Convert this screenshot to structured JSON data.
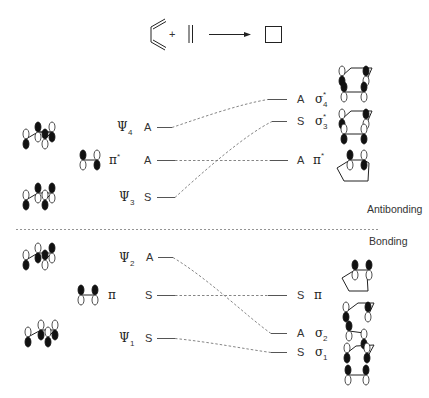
{
  "reaction": {
    "plus": "+",
    "description": "butadiene + ethylene -> cyclobutene-type product (square)"
  },
  "regions": {
    "antibonding": "Antibonding",
    "bonding": "Bonding"
  },
  "left_levels": [
    {
      "name": "Ψ",
      "sub": "4",
      "sym": "A",
      "y": 127
    },
    {
      "name": "π*",
      "sub": "",
      "sym": "A",
      "y": 160
    },
    {
      "name": "Ψ",
      "sub": "3",
      "sym": "S",
      "y": 197
    },
    {
      "name": "Ψ",
      "sub": "2",
      "sym": "A",
      "y": 257
    },
    {
      "name": "π",
      "sub": "",
      "sym": "S",
      "y": 295
    },
    {
      "name": "Ψ",
      "sub": "1",
      "sym": "S",
      "y": 338
    }
  ],
  "right_levels": [
    {
      "name": "σ",
      "sub": "4",
      "sup": "*",
      "sym": "A",
      "y": 99
    },
    {
      "name": "σ",
      "sub": "3",
      "sup": "*",
      "sym": "S",
      "y": 121
    },
    {
      "name": "π*",
      "sub": "",
      "sup": "",
      "sym": "A",
      "y": 160
    },
    {
      "name": "π",
      "sub": "",
      "sup": "",
      "sym": "S",
      "y": 295
    },
    {
      "name": "σ",
      "sub": "2",
      "sup": "",
      "sym": "A",
      "y": 333
    },
    {
      "name": "σ",
      "sub": "1",
      "sup": "",
      "sym": "S",
      "y": 352
    }
  ],
  "correlations": [
    {
      "from": "Ψ4 (A)",
      "to": "σ4* (A)"
    },
    {
      "from": "π* (A)",
      "to": "π* (A)"
    },
    {
      "from": "Ψ3 (S)",
      "to": "σ3* (S)"
    },
    {
      "from": "Ψ2 (A)",
      "to": "σ2 (A)"
    },
    {
      "from": "π (S)",
      "to": "π (S)"
    },
    {
      "from": "Ψ1 (S)",
      "to": "σ1 (S)"
    }
  ],
  "labels": {
    "psi": "Ψ",
    "pi": "π",
    "pi_star": "π*",
    "sigma": "σ",
    "star": "*",
    "sub1": "1",
    "sub2": "2",
    "sub3": "3",
    "sub4": "4",
    "A": "A",
    "S": "S"
  }
}
